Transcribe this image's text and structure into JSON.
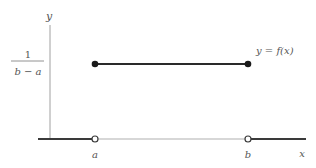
{
  "diagram": {
    "axes": {
      "x_label": "x",
      "y_label": "y"
    },
    "y_tick": {
      "numerator": "1",
      "denominator": "b − a"
    },
    "x_ticks": [
      "a",
      "b"
    ],
    "curve_label": "y = f(x)",
    "segments": [
      {
        "from": "-inf",
        "to": "a",
        "y": 0,
        "style": "dark"
      },
      {
        "from": "a",
        "to": "b",
        "y": "1/(b-a)",
        "style": "dark",
        "endpoints": "closed"
      },
      {
        "from": "a",
        "to": "b",
        "y": 0,
        "style": "light",
        "endpoints": "open"
      },
      {
        "from": "b",
        "to": "+inf",
        "y": 0,
        "style": "dark"
      }
    ],
    "colors": {
      "dark_line": "#3a3a3a",
      "axis": "#9a9a9a",
      "light_line": "#b0b0b0",
      "text": "#555555"
    }
  }
}
